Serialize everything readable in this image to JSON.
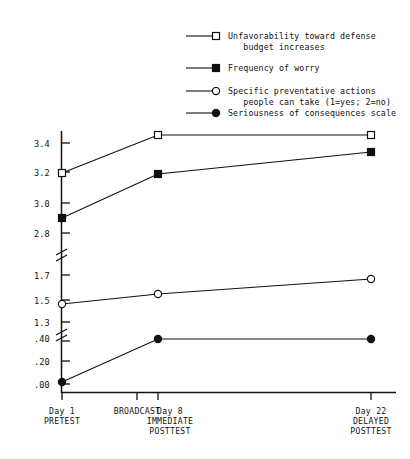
{
  "chart_data": {
    "type": "line",
    "title": "",
    "xlabel": "",
    "ylabel": "",
    "grid": false,
    "legend_position": "top",
    "axis_broken": true,
    "categories": [
      "Day 1 PRETEST",
      "Day 8 IMMEDIATE POSTTEST",
      "Day 22 DELAYED POSTTEST"
    ],
    "x_positions": [
      62,
      158,
      371
    ],
    "x_ticks": [
      {
        "label_lines": [
          "Day 1",
          "PRETEST"
        ],
        "x": 62
      },
      {
        "label_lines": [
          "BROADCAST"
        ],
        "x": 137
      },
      {
        "label_lines": [
          "Day 8",
          "IMMEDIATE",
          "POSTTEST"
        ],
        "x": 158
      },
      {
        "label_lines": [
          "Day 22",
          "DELAYED",
          "POSTTEST"
        ],
        "x": 371
      }
    ],
    "y_ticks": [
      {
        "label": "3.4",
        "y": 143
      },
      {
        "label": "3.2",
        "y": 172
      },
      {
        "label": "3.0",
        "y": 203
      },
      {
        "label": "2.8",
        "y": 233
      },
      {
        "label": "1.7",
        "y": 275
      },
      {
        "label": "1.5",
        "y": 300
      },
      {
        "label": "1.3",
        "y": 322
      },
      {
        "label": ".40",
        "y": 338
      },
      {
        "label": ".20",
        "y": 361
      },
      {
        "label": ".00",
        "y": 384
      }
    ],
    "series": [
      {
        "name": "Unfavorability toward defense budget increases",
        "marker": "open-square",
        "values": [
          3.26,
          3.52,
          3.52
        ],
        "pixel_y": [
          173,
          135,
          135
        ]
      },
      {
        "name": "Frequency of worry",
        "marker": "filled-square",
        "values": [
          2.78,
          3.25,
          3.4
        ],
        "pixel_y": [
          218,
          174,
          152
        ]
      },
      {
        "name": "Specific preventative actions people can take (1=yes; 2=no)",
        "marker": "open-circle",
        "values": [
          1.38,
          1.48,
          1.62
        ],
        "pixel_y": [
          304,
          294,
          279
        ]
      },
      {
        "name": "Seriousness of consequences scale",
        "marker": "filled-circle",
        "values": [
          0.02,
          0.31,
          0.31
        ],
        "pixel_y": [
          382,
          339,
          339
        ]
      }
    ],
    "legend": [
      {
        "marker": "open-square",
        "lines": [
          "Unfavorability toward defense",
          "   budget increases"
        ]
      },
      {
        "marker": "filled-square",
        "lines": [
          "Frequency of worry"
        ]
      },
      {
        "marker": "open-circle",
        "lines": [
          "Specific preventative actions",
          "   people can take (1=yes; 2=no)"
        ]
      },
      {
        "marker": "filled-circle",
        "lines": [
          "Seriousness of consequences scale"
        ]
      }
    ]
  },
  "colors": {
    "ink": "#111111",
    "paper": "#ffffff"
  }
}
